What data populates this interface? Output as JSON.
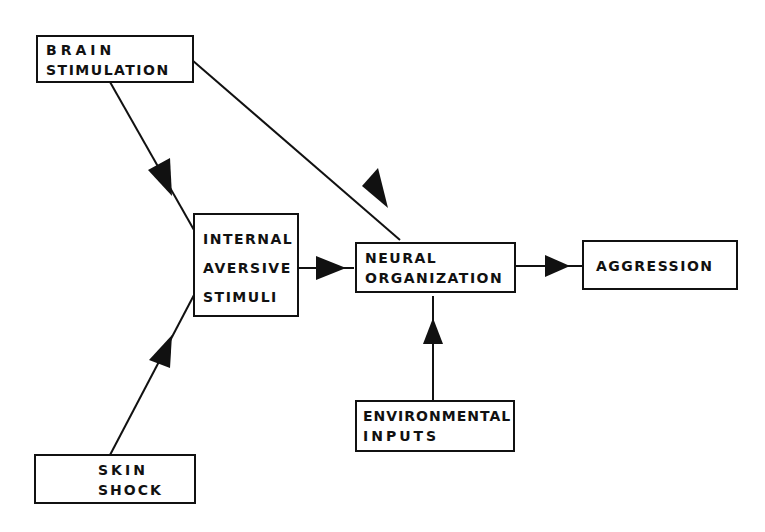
{
  "diagram": {
    "nodes": {
      "brain_stimulation": {
        "line1": "BRAIN",
        "line2": "STIMULATION"
      },
      "internal_aversive_stimuli": {
        "line1": "INTERNAL",
        "line2": "AVERSIVE",
        "line3": "STIMULI"
      },
      "neural_organization": {
        "line1": "NEURAL",
        "line2": "ORGANIZATION"
      },
      "aggression": {
        "line1": "AGGRESSION"
      },
      "environmental_inputs": {
        "line1": "ENVIRONMENTAL",
        "line2": "INPUTS"
      },
      "skin_shock": {
        "line1": "SKIN",
        "line2": "SHOCK"
      }
    },
    "edges": [
      {
        "from": "BRAIN STIMULATION",
        "to": "INTERNAL AVERSIVE STIMULI"
      },
      {
        "from": "BRAIN STIMULATION",
        "to": "NEURAL ORGANIZATION"
      },
      {
        "from": "SKIN SHOCK",
        "to": "INTERNAL AVERSIVE STIMULI"
      },
      {
        "from": "INTERNAL AVERSIVE STIMULI",
        "to": "NEURAL ORGANIZATION"
      },
      {
        "from": "ENVIRONMENTAL INPUTS",
        "to": "NEURAL ORGANIZATION"
      },
      {
        "from": "NEURAL ORGANIZATION",
        "to": "AGGRESSION"
      }
    ]
  }
}
